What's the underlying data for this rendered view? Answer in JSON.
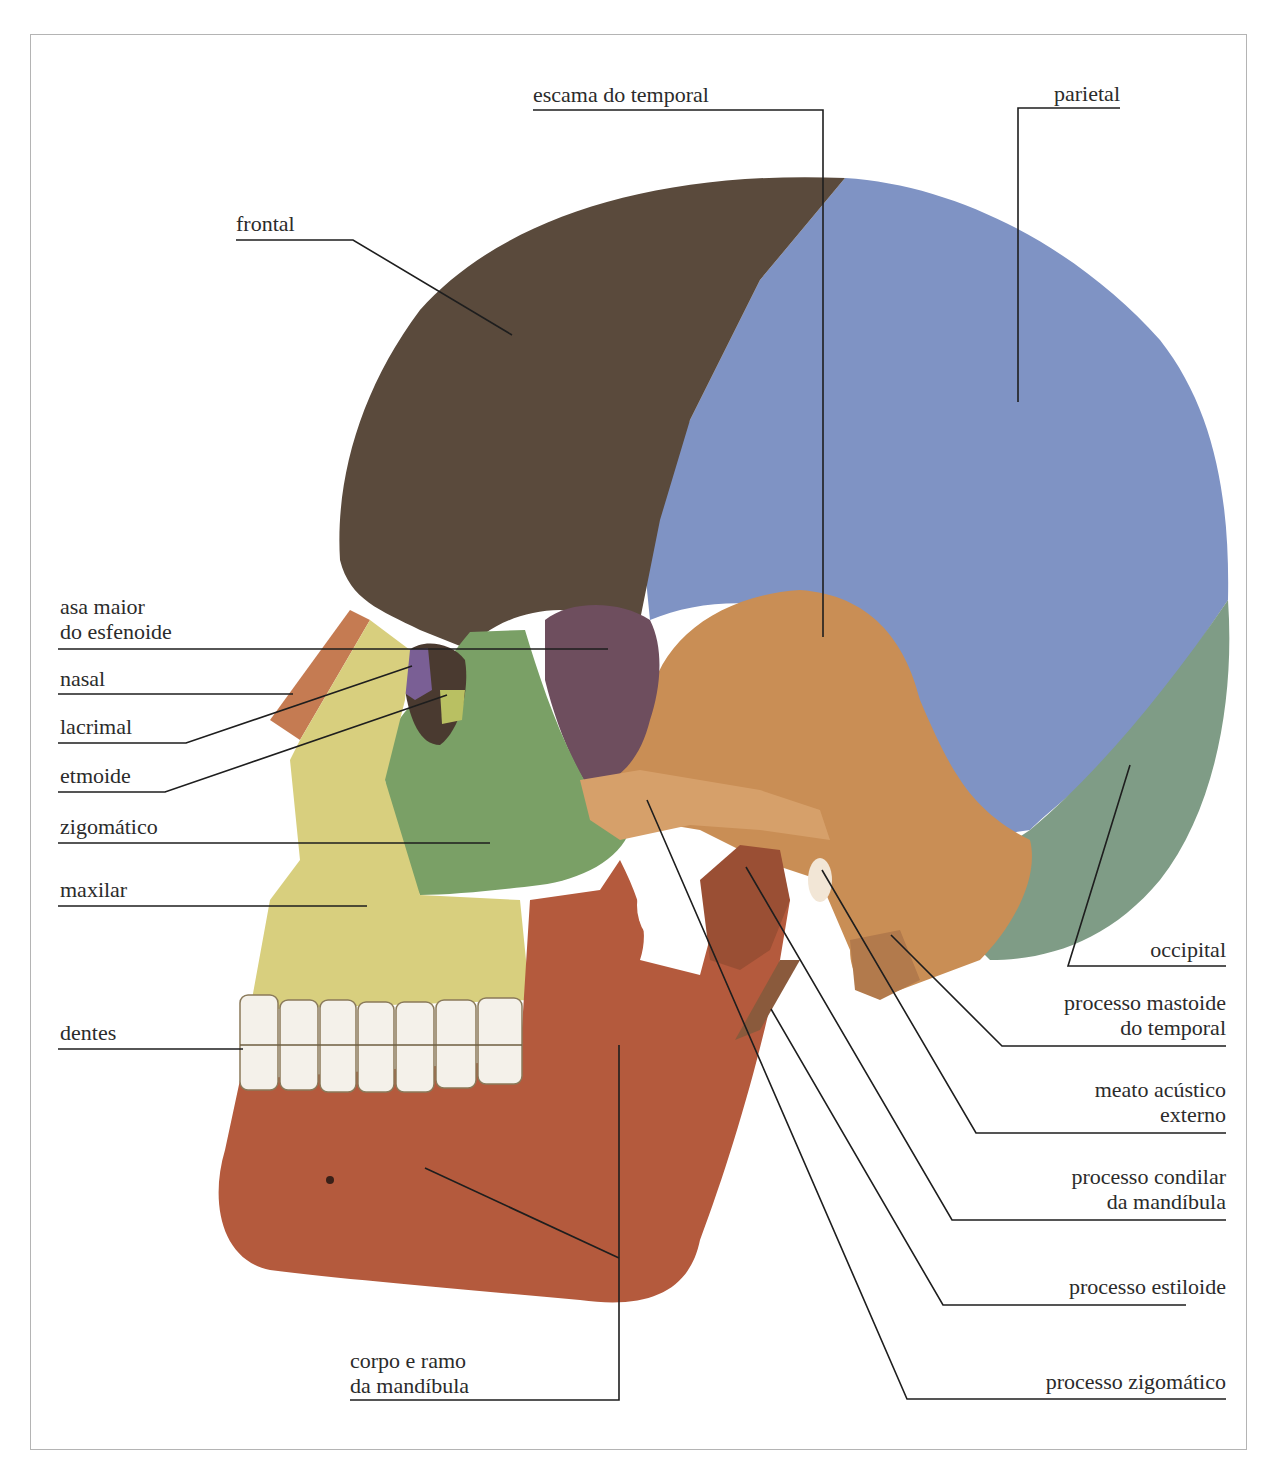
{
  "figure": {
    "colors": {
      "frontal": "#5a4a3c",
      "parietal": "#7f93c4",
      "temporal": "#c98e55",
      "occipital": "#7f9c86",
      "sphenoid": "#6e4e5e",
      "zygomatic": "#7aa066",
      "maxilla": "#d8cf7e",
      "nasal": "#c57b52",
      "lacrimal": "#7a5f95",
      "ethmoid": "#b9c062",
      "mandible": "#b45a3d",
      "teeth": "#f4f1ea",
      "leader_line": "#1e1e1e",
      "frame": "#b4b4b4"
    }
  },
  "labels": {
    "frontal": "frontal",
    "escama_temporal": "escama do temporal",
    "parietal": "parietal",
    "asa_maior_1": "asa maior",
    "asa_maior_2": "do esfenoide",
    "nasal": "nasal",
    "lacrimal": "lacrimal",
    "etmoide": "etmoide",
    "zigomatico": "zigomático",
    "maxilar": "maxilar",
    "dentes": "dentes",
    "corpo_1": "corpo e ramo",
    "corpo_2": "da mandíbula",
    "occipital": "occipital",
    "mastoide_1": "processo mastoide",
    "mastoide_2": "do temporal",
    "meato_1": "meato acústico",
    "meato_2": "externo",
    "condilar_1": "processo condilar",
    "condilar_2": "da mandíbula",
    "estiloide": "processo estiloide",
    "proc_zigomatico": "processo zigomático"
  }
}
